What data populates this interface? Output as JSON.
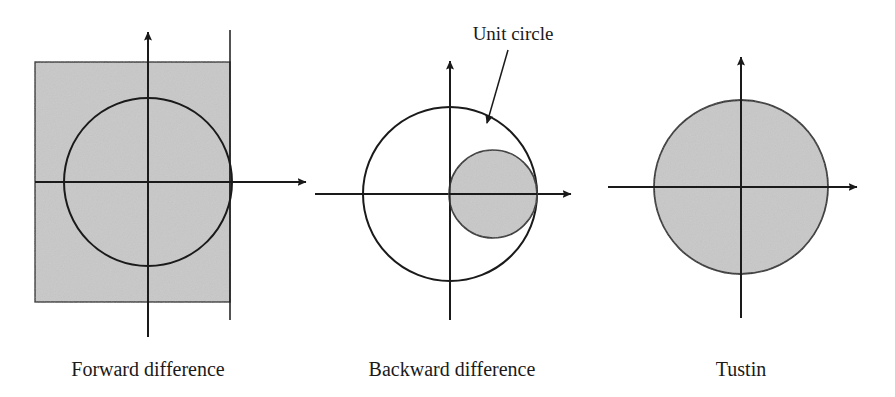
{
  "figure": {
    "background_color": "#ffffff",
    "line_color": "#1a1a1a",
    "shade_color": "#c8c8c8",
    "shade_edge_color": "#2b2b2b",
    "annotation": {
      "label": "Unit circle",
      "label_x": 513,
      "label_y": 40,
      "leader_from_x": 508,
      "leader_from_y": 50,
      "leader_to_x": 487,
      "leader_to_y": 123
    },
    "panels": [
      {
        "id": "forward-difference",
        "caption": "Forward difference",
        "caption_x": 148,
        "caption_y": 376,
        "origin_x": 148,
        "origin_y": 182,
        "x_axis_start": 35,
        "x_axis_end": 306,
        "y_axis_top": 32,
        "y_axis_bottom": 337,
        "region_type": "half-plane-rectangle",
        "shaded_rect": {
          "x": 35,
          "y": 62,
          "width": 195,
          "height": 240
        },
        "boundary_line": {
          "x": 230,
          "y_top": 30,
          "y_bottom": 320
        },
        "unit_circle": {
          "cx": 148,
          "cy": 182,
          "r": 84,
          "filled": false
        }
      },
      {
        "id": "backward-difference",
        "caption": "Backward difference",
        "caption_x": 452,
        "caption_y": 376,
        "origin_x": 450,
        "origin_y": 194,
        "x_axis_start": 315,
        "x_axis_end": 571,
        "y_axis_top": 61,
        "y_axis_bottom": 320,
        "region_type": "small-circle-in-unit-circle",
        "unit_circle": {
          "cx": 450,
          "cy": 194,
          "r": 87,
          "filled": false
        },
        "shaded_circle": {
          "cx": 493,
          "cy": 194,
          "r": 44,
          "filled": true
        }
      },
      {
        "id": "tustin",
        "caption": "Tustin",
        "caption_x": 741,
        "caption_y": 376,
        "origin_x": 741,
        "origin_y": 187,
        "x_axis_start": 608,
        "x_axis_end": 857,
        "y_axis_top": 57,
        "y_axis_bottom": 318,
        "region_type": "full-unit-disk",
        "unit_circle": {
          "cx": 741,
          "cy": 187,
          "r": 87,
          "filled": true
        }
      }
    ]
  }
}
